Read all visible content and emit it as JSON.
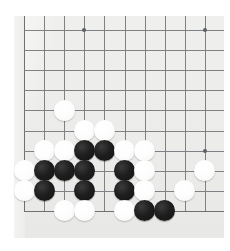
{
  "scene": {
    "title": "Go board position photograph",
    "page_background": "#ffffff"
  },
  "board": {
    "name": "go-board",
    "surface_color": "#ececea",
    "line_color": "#7f8284",
    "origin_x": 24,
    "origin_y": 30,
    "spacing_x": 20.1,
    "spacing_y": 20.1,
    "visible_columns": 10,
    "visible_rows": 10,
    "star_points": [
      {
        "col": 3,
        "row": 0
      },
      {
        "col": 9,
        "row": 0
      },
      {
        "col": 3,
        "row": 6
      },
      {
        "col": 9,
        "row": 6
      }
    ],
    "edges": {
      "left_edge_col": 0,
      "bottom_edge_row": 9
    }
  },
  "stones": {
    "black_color": "#1c1c1c",
    "white_color": "#fbfbf9",
    "counts": {
      "black": 13,
      "white": 20,
      "total": 33
    },
    "placements": [
      {
        "color": "white",
        "col": 2,
        "row": 4
      },
      {
        "color": "white",
        "col": 3,
        "row": 5
      },
      {
        "color": "white",
        "col": 4,
        "row": 5
      },
      {
        "color": "white",
        "col": 1,
        "row": 6
      },
      {
        "color": "white",
        "col": 2,
        "row": 6
      },
      {
        "color": "black",
        "col": 3,
        "row": 6
      },
      {
        "color": "black",
        "col": 4,
        "row": 6
      },
      {
        "color": "white",
        "col": 5,
        "row": 6
      },
      {
        "color": "white",
        "col": 6,
        "row": 6
      },
      {
        "color": "white",
        "col": 0,
        "row": 7
      },
      {
        "color": "black",
        "col": 1,
        "row": 7
      },
      {
        "color": "black",
        "col": 2,
        "row": 7
      },
      {
        "color": "black",
        "col": 3,
        "row": 7
      },
      {
        "color": "black",
        "col": 5,
        "row": 7
      },
      {
        "color": "white",
        "col": 6,
        "row": 7
      },
      {
        "color": "white",
        "col": 9,
        "row": 7
      },
      {
        "color": "white",
        "col": 0,
        "row": 8
      },
      {
        "color": "black",
        "col": 1,
        "row": 8
      },
      {
        "color": "black",
        "col": 3,
        "row": 8
      },
      {
        "color": "black",
        "col": 5,
        "row": 8
      },
      {
        "color": "white",
        "col": 6,
        "row": 8
      },
      {
        "color": "white",
        "col": 8,
        "row": 8
      },
      {
        "color": "white",
        "col": 2,
        "row": 9
      },
      {
        "color": "white",
        "col": 3,
        "row": 9
      },
      {
        "color": "white",
        "col": 5,
        "row": 9
      },
      {
        "color": "black",
        "col": 6,
        "row": 9
      },
      {
        "color": "black",
        "col": 7,
        "row": 9
      }
    ]
  }
}
